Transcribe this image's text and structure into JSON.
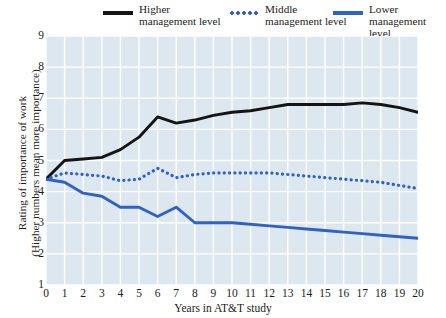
{
  "legend": {
    "items": [
      {
        "label": "Higher\nmanagement level",
        "marker": "solid-line",
        "color": "#141414",
        "name": "legend-higher"
      },
      {
        "label": "Middle\nmanagement level",
        "marker": "dotted-line",
        "color": "#2f62c4",
        "name": "legend-middle"
      },
      {
        "label": "Lower\nmanagement level",
        "marker": "solid-line",
        "color": "#2f62c4",
        "name": "legend-lower"
      }
    ]
  },
  "axes": {
    "xlabel": "Years in AT&T study",
    "ylabel": "Rating of importance of work\n(Higher numbers mean more importance)",
    "xticks": [
      "0",
      "1",
      "2",
      "3",
      "4",
      "5",
      "6",
      "7",
      "8",
      "9",
      "10",
      "11",
      "12",
      "13",
      "14",
      "15",
      "16",
      "17",
      "18",
      "19",
      "20"
    ],
    "yticks": [
      "9",
      "8",
      "7",
      "6",
      "5",
      "4",
      "3",
      "2",
      "1"
    ]
  },
  "colors": {
    "plot_background": "#dde7f0",
    "gridline": "#ffffff",
    "higher": "#141414",
    "middle": "#2f62c4",
    "lower": "#2f62c4"
  },
  "chart_data": {
    "type": "line",
    "title": "",
    "xlabel": "Years in AT&T study",
    "ylabel": "Rating of importance of work (Higher numbers mean more importance)",
    "xlim": [
      0,
      20
    ],
    "ylim": [
      1,
      9
    ],
    "grid": true,
    "legend_position": "top",
    "x": [
      0,
      1,
      2,
      3,
      4,
      5,
      6,
      7,
      8,
      9,
      10,
      11,
      12,
      13,
      14,
      15,
      16,
      17,
      18,
      19,
      20
    ],
    "series": [
      {
        "name": "Higher management level",
        "style": "solid",
        "color": "#141414",
        "values": [
          4.4,
          5.0,
          5.05,
          5.1,
          5.35,
          5.75,
          6.4,
          6.2,
          6.3,
          6.45,
          6.55,
          6.6,
          6.7,
          6.8,
          6.8,
          6.8,
          6.8,
          6.85,
          6.8,
          6.7,
          6.55
        ]
      },
      {
        "name": "Middle management level",
        "style": "dotted",
        "color": "#2f62c4",
        "values": [
          4.4,
          4.6,
          4.55,
          4.5,
          4.35,
          4.4,
          4.75,
          4.45,
          4.55,
          4.6,
          4.6,
          4.6,
          4.6,
          4.55,
          4.5,
          4.45,
          4.4,
          4.35,
          4.3,
          4.2,
          4.1
        ]
      },
      {
        "name": "Lower management level",
        "style": "solid",
        "color": "#2f62c4",
        "values": [
          4.4,
          4.3,
          3.95,
          3.85,
          3.5,
          3.5,
          3.2,
          3.5,
          3.0,
          3.0,
          3.0,
          2.95,
          2.9,
          2.85,
          2.8,
          2.75,
          2.7,
          2.65,
          2.6,
          2.55,
          2.5
        ]
      }
    ]
  }
}
